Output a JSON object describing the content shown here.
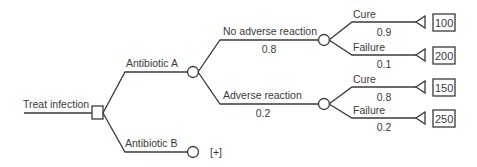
{
  "tree": {
    "root": {
      "label": "Treat infection",
      "node_type": "decision"
    },
    "options": [
      {
        "label": "Antibiotic A",
        "node_type": "chance",
        "branches": [
          {
            "label": "No adverse reaction",
            "probability": "0.8",
            "node_type": "chance",
            "outcomes": [
              {
                "label": "Cure",
                "probability": "0.9",
                "value": "100"
              },
              {
                "label": "Failure",
                "probability": "0.1",
                "value": "200"
              }
            ]
          },
          {
            "label": "Adverse reaction",
            "probability": "0.2",
            "node_type": "chance",
            "outcomes": [
              {
                "label": "Cure",
                "probability": "0.8",
                "value": "150"
              },
              {
                "label": "Failure",
                "probability": "0.2",
                "value": "250"
              }
            ]
          }
        ]
      },
      {
        "label": "Antibiotic B",
        "node_type": "chance",
        "collapsed_marker": "[+]"
      }
    ]
  },
  "colors": {
    "line": "#3a3a3a",
    "background": "#ffffff"
  }
}
